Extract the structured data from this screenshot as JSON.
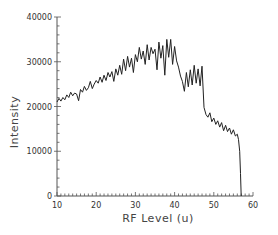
{
  "chart_data": {
    "type": "line",
    "title": "",
    "xlabel": "RF Level (u)",
    "ylabel": "Intensity",
    "xlim": [
      10,
      60
    ],
    "ylim": [
      0,
      40000
    ],
    "x_ticks": [
      10,
      20,
      30,
      40,
      50,
      60
    ],
    "y_ticks": [
      0,
      10000,
      20000,
      30000,
      40000
    ],
    "x_tick_labels": [
      "10",
      "20",
      "30",
      "40",
      "50",
      "60"
    ],
    "y_tick_labels": [
      "0",
      "10000",
      "20000",
      "30000",
      "40000"
    ],
    "grid": false,
    "legend": "none",
    "series": [
      {
        "name": "Intensity",
        "x": [
          10,
          10.5,
          11,
          11.5,
          12,
          12.5,
          13,
          13.5,
          14,
          14.5,
          15,
          15.5,
          16,
          16.5,
          17,
          17.5,
          18,
          18.5,
          19,
          19.5,
          20,
          20.5,
          21,
          21.5,
          22,
          22.5,
          23,
          23.5,
          24,
          24.5,
          25,
          25.5,
          26,
          26.5,
          27,
          27.5,
          28,
          28.5,
          29,
          29.5,
          30,
          30.5,
          31,
          31.5,
          32,
          32.5,
          33,
          33.5,
          34,
          34.5,
          35,
          35.5,
          36,
          36.5,
          37,
          37.5,
          38,
          38.5,
          39,
          39.5,
          40,
          40.5,
          41,
          41.5,
          42,
          42.5,
          43,
          43.5,
          44,
          44.5,
          45,
          45.5,
          46,
          46.5,
          47,
          47.5,
          48,
          48.5,
          49,
          49.5,
          50,
          50.5,
          51,
          51.5,
          52,
          52.5,
          53,
          53.5,
          54,
          54.5,
          55,
          55.5,
          56,
          56.3,
          56.6,
          56.8,
          57
        ],
        "y": [
          21000,
          21800,
          21200,
          22000,
          21500,
          22600,
          22000,
          23200,
          22400,
          23000,
          22800,
          21300,
          23800,
          23200,
          24500,
          23600,
          24200,
          25600,
          24000,
          25000,
          25800,
          25200,
          26600,
          25400,
          27000,
          25800,
          27600,
          26600,
          27800,
          25600,
          28400,
          27000,
          29200,
          27200,
          30600,
          28000,
          31200,
          28800,
          30800,
          27600,
          31600,
          30000,
          33200,
          30600,
          32400,
          29400,
          33800,
          30400,
          33200,
          31800,
          32800,
          28200,
          34400,
          30800,
          33600,
          27000,
          35000,
          31000,
          35000,
          29400,
          33400,
          30200,
          28800,
          26800,
          25600,
          23400,
          27600,
          24400,
          28200,
          24800,
          29200,
          25200,
          28400,
          24600,
          29000,
          19800,
          18200,
          17600,
          18600,
          16600,
          17400,
          16000,
          16800,
          15400,
          16400,
          14600,
          15800,
          14400,
          15200,
          13800,
          14800,
          13400,
          13800,
          12600,
          10000,
          5000,
          0
        ]
      }
    ]
  }
}
